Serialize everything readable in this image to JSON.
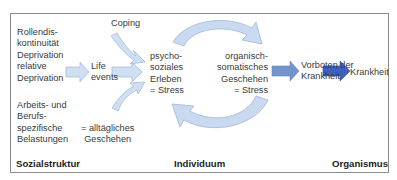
{
  "diagram": {
    "social_factors": {
      "top": "Rollendis-\nkontinuität\nDeprivation\nrelative\nDeprivation",
      "bottom": "Arbeits- und\nBerufs-\nspezifische\nBelastungen"
    },
    "life_events": "Life\nevents",
    "everyday": "= alltägliches\nGeschehen",
    "coping": "Coping",
    "psychosocial": "psycho-\nsoziales\nErleben\n= Stress",
    "organic": "organisch-\nsomatisches\nGeschehen\n= Stress",
    "precursors": "Vorboten der\nKrankheit",
    "disease": "Krankheit",
    "sections": {
      "left": "Sozialstruktur",
      "middle": "Individuum",
      "right": "Organismus"
    },
    "colors": {
      "light_arrow": "#c9daf0",
      "light_arrow_stroke": "#9fb8dc",
      "mid_arrow": "#6f8fc9",
      "dark_arrow": "#3b62b8",
      "frame": "#8c8c8c"
    }
  }
}
